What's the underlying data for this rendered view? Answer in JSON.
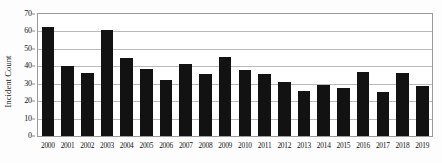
{
  "chart_data": {
    "type": "bar",
    "title": "",
    "xlabel": "",
    "ylabel": "Incident Count",
    "ylim": [
      0,
      70
    ],
    "ytick_step": 10,
    "yticks": [
      0,
      10,
      20,
      30,
      40,
      50,
      60,
      70
    ],
    "grid": true,
    "legend": null,
    "bar_color": "#121212",
    "categories": [
      "2000",
      "2001",
      "2002",
      "2003",
      "2004",
      "2005",
      "2006",
      "2007",
      "2008",
      "2009",
      "2010",
      "2011",
      "2012",
      "2013",
      "2014",
      "2015",
      "2016",
      "2017",
      "2018",
      "2019"
    ],
    "values": [
      62.5,
      40,
      36,
      61,
      44.5,
      38.5,
      32,
      41.5,
      35.5,
      45.5,
      38,
      35.5,
      31,
      26,
      29,
      27.5,
      37,
      25,
      36,
      28.5
    ]
  }
}
